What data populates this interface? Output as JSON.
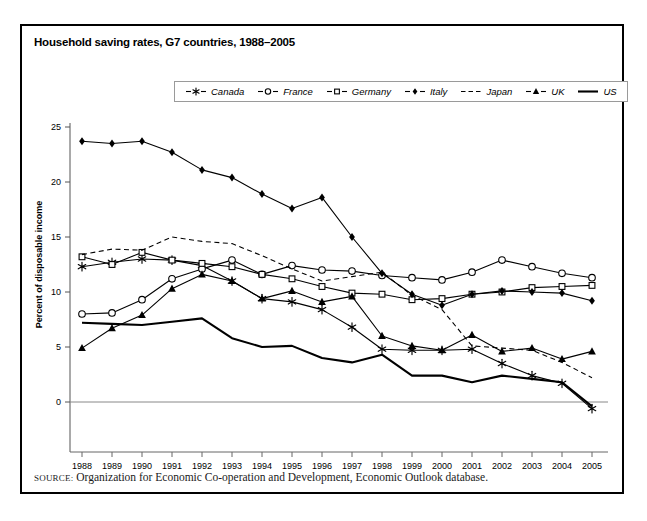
{
  "figure": {
    "title": "Household saving rates, G7 countries, 1988–2005",
    "source_keyword": "SOURCE:",
    "source_text": "Organization for Economic Co-operation and Development, Economic Outlook database."
  },
  "legend": {
    "position": "top-center",
    "entries": [
      {
        "label": "Canada",
        "marker": "asterisk-star-marker",
        "line": "solid"
      },
      {
        "label": "France",
        "marker": "open-circle-marker",
        "line": "solid"
      },
      {
        "label": "Germany",
        "marker": "open-square-marker",
        "line": "solid"
      },
      {
        "label": "Italy",
        "marker": "filled-diamond-marker",
        "line": "solid"
      },
      {
        "label": "Japan",
        "marker": "none",
        "line": "dashed"
      },
      {
        "label": "UK",
        "marker": "filled-triangle-marker",
        "line": "solid"
      },
      {
        "label": "US",
        "marker": "none",
        "line": "solid-thick"
      }
    ]
  },
  "chart_data": {
    "type": "line",
    "title": "Household saving rates, G7 countries, 1988–2005",
    "xlabel": "",
    "ylabel": "Percent of disposable income",
    "categories": [
      "1988",
      "1989",
      "1990",
      "1991",
      "1992",
      "1993",
      "1994",
      "1995",
      "1996",
      "1997",
      "1998",
      "1999",
      "2000",
      "2001",
      "2002",
      "2003",
      "2004",
      "2005"
    ],
    "x": [
      1988,
      1989,
      1990,
      1991,
      1992,
      1993,
      1994,
      1995,
      1996,
      1997,
      1998,
      1999,
      2000,
      2001,
      2002,
      2003,
      2004,
      2005
    ],
    "ylim": [
      -2,
      25
    ],
    "xlim": [
      1988,
      2005
    ],
    "yticks": [
      0,
      5,
      10,
      15,
      20,
      25
    ],
    "grid": false,
    "zero_line": true,
    "series": [
      {
        "name": "Canada",
        "values": [
          12.3,
          12.7,
          13.0,
          12.9,
          12.4,
          11.0,
          9.4,
          9.1,
          8.4,
          6.8,
          4.8,
          4.7,
          4.7,
          4.8,
          3.5,
          2.4,
          1.7,
          -0.6
        ]
      },
      {
        "name": "France",
        "values": [
          8.0,
          8.1,
          9.3,
          11.2,
          12.1,
          12.9,
          11.6,
          12.4,
          12.0,
          11.9,
          11.5,
          11.3,
          11.1,
          11.8,
          12.9,
          12.3,
          11.7,
          11.3
        ]
      },
      {
        "name": "Germany",
        "values": [
          13.2,
          12.5,
          13.6,
          12.9,
          12.6,
          12.3,
          11.6,
          11.2,
          10.5,
          9.9,
          9.8,
          9.3,
          9.4,
          9.8,
          10.0,
          10.4,
          10.5,
          10.6
        ]
      },
      {
        "name": "Italy",
        "values": [
          23.7,
          23.5,
          23.7,
          22.7,
          21.1,
          20.4,
          18.9,
          17.6,
          18.6,
          15.0,
          11.7,
          9.8,
          8.8,
          9.8,
          10.1,
          10.0,
          9.9,
          9.2
        ]
      },
      {
        "name": "Japan",
        "values": [
          13.4,
          13.9,
          13.8,
          15.0,
          14.6,
          14.4,
          13.3,
          12.1,
          11.0,
          11.4,
          11.8,
          9.7,
          8.4,
          5.1,
          4.9,
          4.7,
          3.6,
          2.2
        ]
      },
      {
        "name": "UK",
        "values": [
          4.9,
          6.7,
          7.9,
          10.3,
          11.6,
          11.0,
          9.4,
          10.1,
          9.1,
          9.6,
          6.0,
          5.1,
          4.7,
          6.1,
          4.6,
          4.9,
          3.9,
          4.6
        ]
      },
      {
        "name": "US",
        "values": [
          7.2,
          7.1,
          7.0,
          7.3,
          7.6,
          5.8,
          5.0,
          5.1,
          4.0,
          3.6,
          4.3,
          2.4,
          2.4,
          1.8,
          2.4,
          2.1,
          1.8,
          -0.4
        ]
      }
    ]
  },
  "axes": {
    "y_tick_labels": [
      "25",
      "20",
      "15",
      "10",
      "5",
      "0"
    ],
    "x_tick_labels": [
      "1988",
      "1989",
      "1990",
      "1991",
      "1992",
      "1993",
      "1994",
      "1995",
      "1996",
      "1997",
      "1998",
      "1999",
      "2000",
      "2001",
      "2002",
      "2003",
      "2004",
      "2005"
    ]
  }
}
